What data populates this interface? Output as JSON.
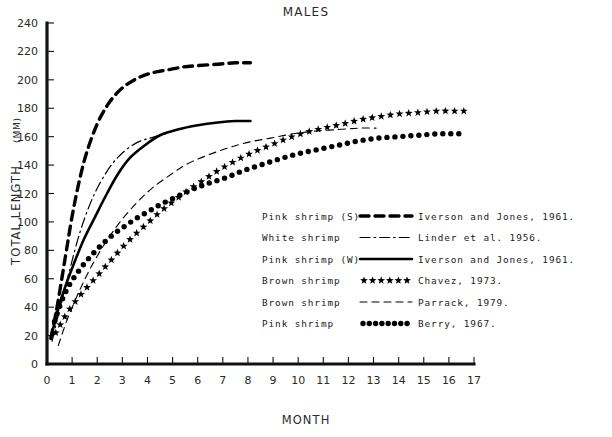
{
  "chart_data": {
    "type": "line",
    "title": "MALES",
    "xlabel": "MONTH",
    "ylabel": "TOTAL LENGTH (MM)",
    "xlim": [
      0,
      17
    ],
    "ylim": [
      0,
      240
    ],
    "xticks": [
      0,
      1,
      2,
      3,
      4,
      5,
      6,
      7,
      8,
      9,
      10,
      11,
      12,
      13,
      14,
      15,
      16,
      17
    ],
    "yticks": [
      0,
      20,
      40,
      60,
      80,
      100,
      120,
      140,
      160,
      180,
      200,
      220,
      240
    ],
    "grid": false,
    "legend_position": "inside-right",
    "series": [
      {
        "name": "Pink shrimp (S)",
        "source": "Iverson and Jones, 1961.",
        "style": "thick-dashed",
        "stroke_width": 3.4,
        "dasharray": "9,6",
        "x": [
          0.15,
          0.4,
          0.7,
          1.0,
          1.3,
          1.6,
          2.0,
          2.4,
          2.8,
          3.2,
          3.7,
          4.2,
          4.8,
          5.4,
          6.0,
          6.8,
          7.5,
          8.1
        ],
        "y": [
          18,
          40,
          72,
          104,
          130,
          150,
          169,
          182,
          191,
          197,
          202,
          205,
          207,
          209,
          210,
          211,
          212,
          212
        ]
      },
      {
        "name": "White shrimp",
        "source": "Linder et al. 1956.",
        "style": "dash-dot",
        "stroke_width": 1.2,
        "dasharray": "10,4,1.6,4",
        "x": [
          0.2,
          0.5,
          0.9,
          1.3,
          1.7,
          2.1,
          2.6,
          3.1,
          3.6,
          4.1,
          4.5,
          4.8
        ],
        "y": [
          16,
          38,
          66,
          92,
          112,
          127,
          141,
          150,
          156,
          159,
          161,
          162
        ]
      },
      {
        "name": "Pink shrimp (W)",
        "source": "Iverson and Jones, 1961.",
        "style": "solid",
        "stroke_width": 2.6,
        "dasharray": "none",
        "x": [
          0.2,
          0.5,
          0.8,
          1.1,
          1.5,
          1.9,
          2.3,
          2.8,
          3.3,
          3.9,
          4.5,
          5.2,
          6.0,
          6.8,
          7.5,
          8.1
        ],
        "y": [
          22,
          42,
          58,
          72,
          89,
          103,
          117,
          133,
          145,
          154,
          161,
          165,
          168,
          170,
          171,
          171
        ]
      },
      {
        "name": "Brown shrimp",
        "source": "Chavez, 1973.",
        "style": "stars",
        "stroke_width": 0,
        "dasharray": "none",
        "x": [
          0.35,
          0.7,
          1.0,
          1.4,
          1.8,
          2.2,
          2.6,
          3.0,
          3.5,
          4.0,
          4.5,
          5.0,
          5.6,
          6.2,
          6.8,
          7.5,
          8.2,
          8.9,
          9.6,
          10.3,
          11.0,
          11.8,
          12.5,
          13.2,
          14.0,
          14.8,
          15.5,
          16.2,
          16.6
        ],
        "y": [
          22,
          33,
          41,
          50,
          58,
          66,
          74,
          82,
          91,
          99,
          107,
          114,
          122,
          129,
          136,
          143,
          149,
          154,
          159,
          163,
          166,
          169,
          172,
          174,
          176,
          177,
          178,
          178,
          178
        ]
      },
      {
        "name": "Brown shrimp",
        "source": "Parrack, 1979.",
        "style": "thin-dashed",
        "stroke_width": 1.1,
        "dasharray": "7,5",
        "x": [
          0.45,
          0.8,
          1.2,
          1.6,
          2.0,
          2.5,
          3.0,
          3.6,
          4.2,
          4.9,
          5.6,
          6.4,
          7.2,
          8.0,
          8.9,
          9.8,
          10.7,
          11.6,
          12.4,
          13.1
        ],
        "y": [
          13,
          31,
          48,
          63,
          76,
          90,
          102,
          114,
          124,
          133,
          141,
          147,
          152,
          156,
          159,
          162,
          164,
          165,
          166,
          166
        ]
      },
      {
        "name": "Pink shrimp",
        "source": "Berry, 1967.",
        "style": "dots",
        "stroke_width": 0,
        "dasharray": "none",
        "x": [
          0.3,
          0.6,
          0.9,
          1.2,
          1.5,
          1.9,
          2.3,
          2.7,
          3.1,
          3.6,
          4.1,
          4.6,
          5.2,
          5.8,
          6.4,
          7.1,
          7.8,
          8.5,
          9.2,
          10.0,
          10.8,
          11.6,
          12.4,
          13.2,
          14.0,
          14.8,
          15.6,
          16.3,
          16.7
        ],
        "y": [
          30,
          45,
          56,
          64,
          71,
          79,
          86,
          92,
          97,
          103,
          108,
          113,
          118,
          123,
          127,
          131,
          136,
          140,
          144,
          148,
          151,
          154,
          157,
          159,
          160,
          161,
          162,
          162,
          162
        ]
      }
    ]
  },
  "legend": {
    "rows": [
      {
        "label": "Pink shrimp (S)",
        "marker": "thick-dashed-marker",
        "citation": "Iverson and Jones, 1961."
      },
      {
        "label": "White shrimp",
        "marker": "dash-dot-marker",
        "citation": "Linder et al. 1956."
      },
      {
        "label": "Pink shrimp (W)",
        "marker": "solid-marker",
        "citation": "Iverson and Jones, 1961."
      },
      {
        "label": "Brown shrimp",
        "marker": "stars-marker",
        "citation": "Chavez, 1973."
      },
      {
        "label": "Brown shrimp",
        "marker": "thin-dashed-marker",
        "citation": "Parrack, 1979."
      },
      {
        "label": "Pink shrimp",
        "marker": "dots-marker",
        "citation": "Berry, 1967."
      }
    ]
  },
  "colors": {
    "ink": "#000000",
    "background": "#ffffff",
    "text": "#2a2a2a"
  }
}
